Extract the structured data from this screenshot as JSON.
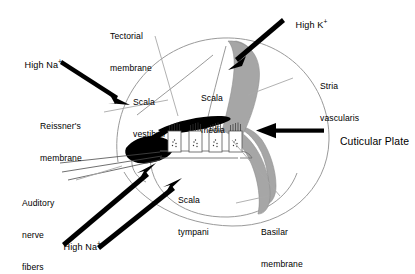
{
  "figure": {
    "type": "anatomical-diagram"
  },
  "colors": {
    "outline": "#9a9a9a",
    "leader": "#a8a8a8",
    "stria_fill": "#a6a6a6",
    "tectorial_fill": "#000000",
    "arrow": "#000000",
    "text": "#000000",
    "background": "#ffffff"
  },
  "labels": {
    "tectorial_membrane": "Tectorial\nmembrane",
    "scala_vestibuli": "Scala\nvestibuli",
    "scala_media": "Scala\nmedia",
    "scala_tympani": "Scala\ntympani",
    "reissners_membrane": "Reissner's\nmembrane",
    "stria_vascularis": "Stria\nvascularis",
    "basilar_membrane": "Basilar\nmembrane",
    "auditory_nerve_fibers": "Auditory\nnerve\nfibers",
    "cuticular_plate": "Cuticular Plate"
  },
  "ion_arrows": [
    {
      "id": "high-na-upper-left",
      "ion": "Na",
      "charge": "+",
      "text": "High Na",
      "superscript": "+"
    },
    {
      "id": "high-k-top-right",
      "ion": "K",
      "charge": "+",
      "text": "High K",
      "superscript": "+"
    },
    {
      "id": "high-na-lower-left",
      "ion": "Na",
      "charge": "+",
      "text": "High Na",
      "superscript": "+"
    }
  ],
  "hair_cells": {
    "count": 4,
    "feature": "stereocilia bundle",
    "nucleus": "granular"
  }
}
